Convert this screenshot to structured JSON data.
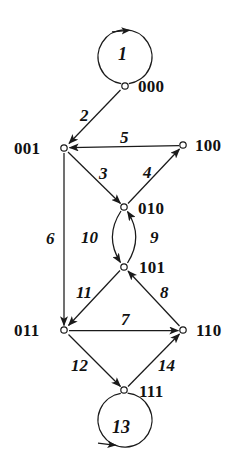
{
  "diagram": {
    "type": "directed-graph",
    "width": 238,
    "height": 470,
    "background_color": "#ffffff",
    "stroke_color": "#1a1a1a",
    "nodes": [
      {
        "id": "000",
        "label": "000",
        "x": 125,
        "y": 86,
        "label_x": 138,
        "label_y": 78
      },
      {
        "id": "001",
        "label": "001",
        "x": 64,
        "y": 148,
        "label_x": 14,
        "label_y": 140
      },
      {
        "id": "100",
        "label": "100",
        "x": 183,
        "y": 145,
        "label_x": 195,
        "label_y": 137
      },
      {
        "id": "010",
        "label": "010",
        "x": 124,
        "y": 207,
        "label_x": 138,
        "label_y": 200
      },
      {
        "id": "101",
        "label": "101",
        "x": 124,
        "y": 267,
        "label_x": 139,
        "label_y": 259
      },
      {
        "id": "011",
        "label": "011",
        "x": 64,
        "y": 330,
        "label_x": 14,
        "label_y": 322
      },
      {
        "id": "110",
        "label": "110",
        "x": 183,
        "y": 330,
        "label_x": 196,
        "label_y": 322
      },
      {
        "id": "111",
        "label": "111",
        "x": 124,
        "y": 390,
        "label_x": 139,
        "label_y": 383
      }
    ],
    "edges": [
      {
        "id": "e1",
        "label": "1",
        "from": "000",
        "to": "000",
        "kind": "self-loop",
        "label_x": 118,
        "label_y": 45
      },
      {
        "id": "e2",
        "label": "2",
        "from": "000",
        "to": "001",
        "kind": "straight",
        "label_x": 80,
        "label_y": 107
      },
      {
        "id": "e3",
        "label": "3",
        "from": "001",
        "to": "010",
        "kind": "straight",
        "label_x": 99,
        "label_y": 165
      },
      {
        "id": "e4",
        "label": "4",
        "from": "010",
        "to": "100",
        "kind": "straight",
        "label_x": 143,
        "label_y": 164
      },
      {
        "id": "e5",
        "label": "5",
        "from": "100",
        "to": "001",
        "kind": "straight",
        "label_x": 120,
        "label_y": 129
      },
      {
        "id": "e6",
        "label": "6",
        "from": "001",
        "to": "011",
        "kind": "straight",
        "label_x": 46,
        "label_y": 230
      },
      {
        "id": "e7",
        "label": "7",
        "from": "011",
        "to": "110",
        "kind": "straight",
        "label_x": 121,
        "label_y": 311
      },
      {
        "id": "e8",
        "label": "8",
        "from": "110",
        "to": "101",
        "kind": "straight",
        "label_x": 160,
        "label_y": 284
      },
      {
        "id": "e9",
        "label": "9",
        "from": "101",
        "to": "010",
        "kind": "arc-right",
        "label_x": 150,
        "label_y": 229
      },
      {
        "id": "e10",
        "label": "10",
        "from": "010",
        "to": "101",
        "kind": "arc-left",
        "label_x": 81,
        "label_y": 229
      },
      {
        "id": "e11",
        "label": "11",
        "from": "101",
        "to": "011",
        "kind": "straight",
        "label_x": 76,
        "label_y": 284
      },
      {
        "id": "e12",
        "label": "12",
        "from": "011",
        "to": "111",
        "kind": "straight",
        "label_x": 71,
        "label_y": 357
      },
      {
        "id": "e13",
        "label": "13",
        "from": "111",
        "to": "111",
        "kind": "self-loop",
        "label_x": 112,
        "label_y": 418
      },
      {
        "id": "e14",
        "label": "14",
        "from": "111",
        "to": "110",
        "kind": "straight",
        "label_x": 158,
        "label_y": 357
      }
    ]
  }
}
